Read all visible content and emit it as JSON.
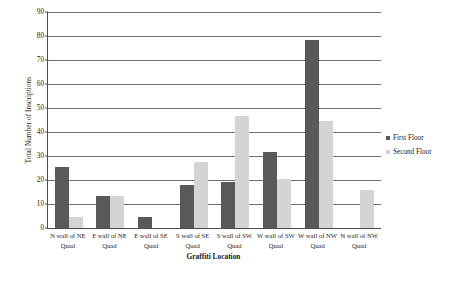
{
  "chart_data": {
    "type": "bar",
    "title": "",
    "subtitle": "",
    "xlabel": "Graffiti Location",
    "ylabel": "Total Number of Inscriptions",
    "ylim": [
      0,
      90
    ],
    "ytick_step": 10,
    "yticks": [
      0,
      10,
      20,
      30,
      40,
      50,
      60,
      70,
      80,
      90
    ],
    "ytick_labels": [
      "0",
      "10",
      "20",
      "30",
      "40",
      "50",
      "60",
      "70",
      "80",
      "90"
    ],
    "grid": "horizontal",
    "legend_position": "right",
    "categories": [
      "N wall of NE Quad",
      "E wall of NE Quad",
      "E wall of SE Quad",
      "S wall of SE Quad",
      "S wall of SW Quad",
      "W wall of SW Quad",
      "W wall of NW Quad",
      "N wall of NW Quad"
    ],
    "category_lines": [
      [
        "N wall of NE",
        "Quad"
      ],
      [
        "E wall of NE",
        "Quad"
      ],
      [
        "E wall of SE",
        "Quad"
      ],
      [
        "S wall of SE",
        "Quad"
      ],
      [
        "S wall of SW",
        "Quad"
      ],
      [
        "W wall of SW",
        "Quad"
      ],
      [
        "W wall of NW",
        "Quad"
      ],
      [
        "N wall of NW",
        "Quad"
      ]
    ],
    "series": [
      {
        "name": "First Floor",
        "color": "#595959",
        "values": [
          25.5,
          13.5,
          4.5,
          18,
          19,
          31.5,
          78.5,
          0
        ]
      },
      {
        "name": "Second Floor",
        "color": "#d4d4d4",
        "values": [
          4.5,
          13.5,
          0,
          27.5,
          46.5,
          20.5,
          44.5,
          16
        ]
      }
    ]
  },
  "legend": {
    "items": [
      {
        "label": "First Floor"
      },
      {
        "label": "Second Floor"
      }
    ]
  },
  "colors": {
    "first_floor": "#595959",
    "second_floor": "#d4d4d4",
    "axis": "#4d4d4d",
    "gridline": "#6e6e6e",
    "background": "#ffffff",
    "text": "#1a1a1a"
  }
}
